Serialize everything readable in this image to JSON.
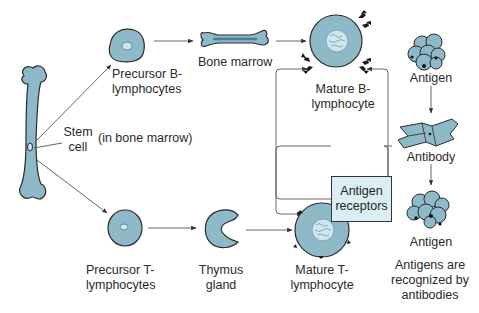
{
  "diagram": {
    "colors": {
      "cell_fill": "#8db9c9",
      "cell_stroke": "#2b2b2b",
      "nucleus_fill": "#cfe6ee",
      "box_fill": "#dbeef5",
      "arrow": "#444444",
      "connector": "#555555"
    },
    "labels": {
      "stem_cell": "Stem\ncell",
      "in_bone_marrow": "(in bone marrow)",
      "precursor_b": "Precursor B-\nlymphocytes",
      "bone_marrow": "Bone marrow",
      "mature_b": "Mature B-\nlymphocyte",
      "antigen_receptors": "Antigen\nreceptors",
      "precursor_t": "Precursor T-\nlymphocytes",
      "thymus_gland": "Thymus\ngland",
      "mature_t": "Mature T-\nlymphocyte",
      "antigen_top": "Antigen",
      "antibody": "Antibody",
      "antigen_bottom": "Antigen",
      "caption": "Antigens are\nrecognized by\nantibodies"
    },
    "nodes": [
      {
        "id": "femur",
        "type": "long-bone"
      },
      {
        "id": "precursor_b",
        "type": "cell"
      },
      {
        "id": "bone_marrow",
        "type": "bone"
      },
      {
        "id": "mature_b",
        "type": "cell-with-receptors"
      },
      {
        "id": "precursor_t",
        "type": "cell"
      },
      {
        "id": "thymus",
        "type": "organ"
      },
      {
        "id": "mature_t",
        "type": "cell-with-receptors"
      },
      {
        "id": "antigen_top",
        "type": "antigen-cluster"
      },
      {
        "id": "antibody",
        "type": "antibody"
      },
      {
        "id": "antigen_bottom",
        "type": "antigen-cluster"
      }
    ],
    "edges": [
      {
        "from": "femur",
        "to": "precursor_b"
      },
      {
        "from": "precursor_b",
        "to": "bone_marrow"
      },
      {
        "from": "bone_marrow",
        "to": "mature_b"
      },
      {
        "from": "femur",
        "to": "precursor_t"
      },
      {
        "from": "precursor_t",
        "to": "thymus"
      },
      {
        "from": "thymus",
        "to": "mature_t"
      },
      {
        "from": "antigen_top",
        "to": "antibody"
      },
      {
        "from": "antibody",
        "to": "antigen_bottom"
      },
      {
        "from": "antigen_receptors",
        "to": "mature_b"
      },
      {
        "from": "antigen_receptors",
        "to": "mature_t"
      }
    ]
  }
}
